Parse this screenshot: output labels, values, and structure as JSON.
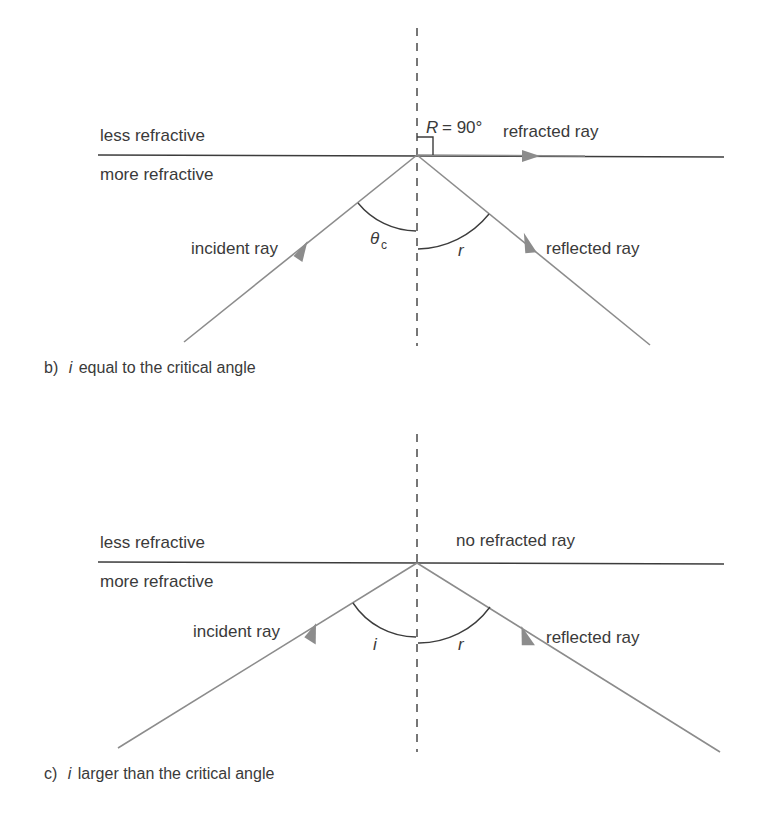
{
  "figure_b": {
    "medium_top": "less refractive",
    "medium_bottom": "more refractive",
    "incident_label": "incident ray",
    "reflected_label": "reflected ray",
    "refracted_label": "refracted ray",
    "refraction_angle_symbol": "R",
    "refraction_angle_eq": "= 90°",
    "incidence_angle_symbol": "θ",
    "incidence_angle_subscript": "c",
    "reflection_angle_symbol": "r",
    "caption_prefix": "b)",
    "caption_symbol": "i",
    "caption_text": "equal to the critical angle"
  },
  "figure_c": {
    "medium_top": "less refractive",
    "medium_bottom": "more refractive",
    "incident_label": "incident ray",
    "reflected_label": "reflected ray",
    "refracted_label": "no refracted ray",
    "incidence_angle_symbol": "i",
    "reflection_angle_symbol": "r",
    "caption_prefix": "c)",
    "caption_symbol": "i",
    "caption_text": "larger than the critical angle"
  }
}
